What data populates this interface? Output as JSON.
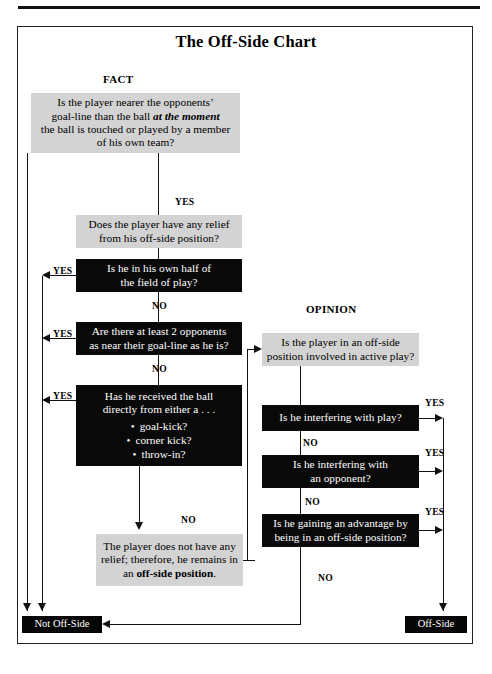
{
  "page": {
    "title": "The Off-Side Chart"
  },
  "headings": {
    "fact": "FACT",
    "opinion": "OPINION"
  },
  "labels": {
    "yes": "YES",
    "no": "NO"
  },
  "fact_branch": {
    "q0": {
      "text_1": "Is the player nearer the opponents’",
      "text_2a": "goal-line than the ball ",
      "text_2b": "at the moment",
      "text_3": "the ball is touched or played by a member",
      "text_4": "of his own team?"
    },
    "q1": {
      "text_1": "Does the player have any relief",
      "text_2": "from his off-side position?"
    },
    "q2": {
      "text_1": "Is he in his own half of",
      "text_2": "the field of play?"
    },
    "q3": {
      "text_1": "Are there at least 2 opponents",
      "text_2": "as near their goal-line as he is?"
    },
    "q4": {
      "text_1": "Has he received the ball",
      "text_2": "directly from either a . . .",
      "bullets": [
        "goal-kick?",
        "corner kick?",
        "throw-in?"
      ]
    },
    "result": {
      "text_1": "The player does not have any",
      "text_2": "relief; therefore, he remains in",
      "text_3a": "an ",
      "text_3b": "off-side position",
      "text_3c": "."
    }
  },
  "opinion_branch": {
    "q5": {
      "text_1": "Is the player in an off-side",
      "text_2": "position involved in active play?"
    },
    "q6": {
      "text_1": "Is he interfering with play?"
    },
    "q7": {
      "text_1": "Is he interfering with",
      "text_2": "an opponent?"
    },
    "q8": {
      "text_1": "Is he gaining an advantage by",
      "text_2": "being in an off-side position?"
    }
  },
  "terminals": {
    "not_offside": "Not Off-Side",
    "offside": "Off-Side"
  },
  "colors": {
    "decision_gray": "#d3d3d3",
    "decision_black": "#090909",
    "line": "#111111",
    "text_on_black": "#ffffff",
    "page_background": "#ffffff"
  }
}
